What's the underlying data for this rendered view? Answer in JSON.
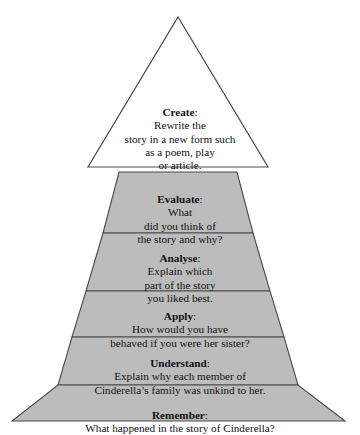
{
  "diagram": {
    "type": "pyramid",
    "colors": {
      "band_fill": "#bcbcbc",
      "apex_fill": "#ffffff",
      "stroke": "#4a4a4a",
      "text": "#111111",
      "background": "#ffffff"
    },
    "levels": [
      {
        "id": "create",
        "order": 6,
        "shape": "triangle",
        "fill": "#ffffff",
        "term": "Create",
        "separator": ":",
        "prompt": "Rewrite the\nstory in a new form such\nas a poem, play\nor article.",
        "full_text": "Create: Rewrite the story in a new form such as a poem, play or article."
      },
      {
        "id": "evaluate",
        "order": 5,
        "shape": "trapezoid",
        "fill": "#bcbcbc",
        "term": "Evaluate",
        "separator": ":",
        "prompt": "What\ndid you think of\nthe story and why?",
        "full_text": "Evaluate: What did you think of the story and why?"
      },
      {
        "id": "analyse",
        "order": 4,
        "shape": "trapezoid",
        "fill": "#bcbcbc",
        "term": "Analyse",
        "separator": ":",
        "prompt": "Explain which\npart of the story\nyou liked best.",
        "full_text": "Analyse: Explain which part of the story you liked best."
      },
      {
        "id": "apply",
        "order": 3,
        "shape": "trapezoid",
        "fill": "#bcbcbc",
        "term": "Apply",
        "separator": ":",
        "prompt": "How would you have\nbehaved if you were her sister?",
        "full_text": "Apply: How would you have behaved if you were her sister?"
      },
      {
        "id": "understand",
        "order": 2,
        "shape": "trapezoid",
        "fill": "#bcbcbc",
        "term": "Understand",
        "separator": ":",
        "prompt": "Explain why each member of\nCinderella’s family was unkind to her.",
        "full_text": "Understand: Explain why each member of Cinderella’s family was unkind to her."
      },
      {
        "id": "remember",
        "order": 1,
        "shape": "trapezoid",
        "fill": "#bcbcbc",
        "term": "Remember",
        "separator": ":",
        "prompt": "What happened in the story of Cinderella?",
        "full_text": "Remember: What happened in the story of Cinderella?"
      }
    ]
  }
}
